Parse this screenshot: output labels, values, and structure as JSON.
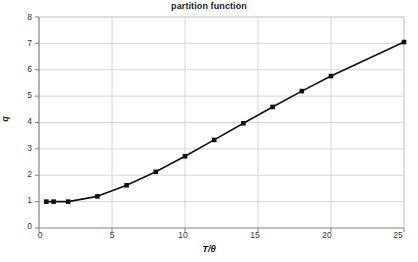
{
  "chart_data": {
    "type": "line",
    "title": "partition function",
    "xlabel": "T/θ",
    "ylabel": "q",
    "xlim": [
      0,
      25
    ],
    "ylim": [
      0,
      8
    ],
    "xticks": [
      0,
      5,
      10,
      15,
      20,
      25
    ],
    "yticks": [
      0,
      1,
      2,
      3,
      4,
      5,
      6,
      7,
      8
    ],
    "xtick_labels": [
      "0",
      "5",
      "10",
      "15",
      "20",
      "25"
    ],
    "ytick_labels": [
      "0",
      "1",
      "2",
      "3",
      "4",
      "5",
      "6",
      "7",
      "8"
    ],
    "grid": true,
    "legend": false,
    "marker": "square",
    "marker_color": "#111111",
    "line_color": "#111111",
    "grid_color": "#cccccc",
    "axis_color": "#808080",
    "background": "#ffffff",
    "series": [
      {
        "name": "q",
        "x": [
          0.5,
          1,
          2,
          4,
          6,
          8,
          10,
          12,
          14,
          16,
          18,
          20,
          25
        ],
        "values": [
          1.0,
          1.0,
          1.0,
          1.2,
          1.62,
          2.13,
          2.72,
          3.34,
          3.97,
          4.59,
          5.19,
          5.76,
          7.05
        ]
      }
    ]
  },
  "axis": {
    "ytick_0": "0",
    "ytick_1": "1",
    "ytick_2": "2",
    "ytick_3": "3",
    "ytick_4": "4",
    "ytick_5": "5",
    "ytick_6": "6",
    "ytick_7": "7",
    "ytick_8": "8",
    "xtick_0": "0",
    "xtick_5": "5",
    "xtick_10": "10",
    "xtick_15": "15",
    "xtick_20": "20",
    "xtick_25": "25"
  }
}
